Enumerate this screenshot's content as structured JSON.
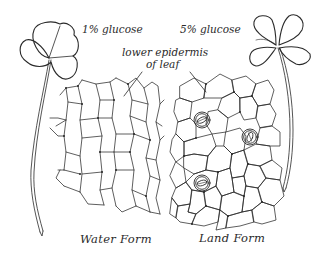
{
  "figure": {
    "labels": {
      "left_concentration": "1% glucose",
      "right_concentration": "5% glucose",
      "tissue_line1": "lower epidermis",
      "tissue_line2": "of leaf",
      "left_form": "Water Form",
      "right_form": "Land Form"
    },
    "left_panel": {
      "leaf_type": "three-lobed leaf on long stalk",
      "tissue": "elongated epidermal cells, no stomata",
      "stomata_count": 0
    },
    "right_panel": {
      "leaf_type": "four-lobed clover leaf on long stalk",
      "tissue": "rounded polygonal epidermal cells with stomata",
      "stomata_count": 3
    },
    "colors": {
      "ink": "#2a2a2a",
      "background": "#ffffff"
    }
  }
}
